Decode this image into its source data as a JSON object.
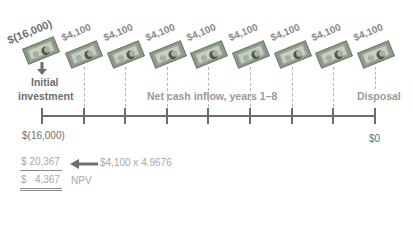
{
  "diagram": {
    "initial": {
      "bill_label": "$(16,000)",
      "label_line1": "Initial",
      "label_line2": "investment",
      "value": "$(16,000)"
    },
    "inflows": {
      "bill_labels": [
        "$4,100",
        "$4,100",
        "$4,100",
        "$4,100",
        "$4,100",
        "$4,100",
        "$4,100",
        "$4,100"
      ],
      "label": "Net cash inflow, years 1–8"
    },
    "disposal": {
      "label": "Disposal",
      "value": "$0"
    },
    "calc": {
      "pv_value": "$ 20,367",
      "arrow_note": "$4,100 x 4.9676",
      "npv_value": "$   4,367",
      "npv_label": "NPV"
    },
    "colors": {
      "line": "#6c6c6c",
      "text_dark": "#6e6e6e",
      "text_light": "#a8a8a8",
      "bill": "#8c9a88"
    }
  }
}
